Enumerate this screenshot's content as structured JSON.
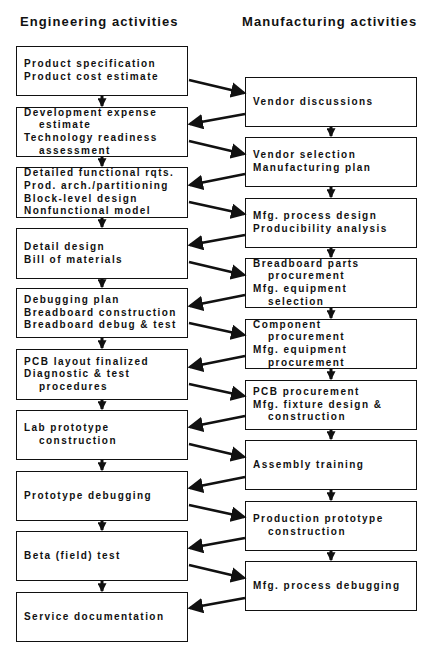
{
  "headers": {
    "engineering": "Engineering activities",
    "manufacturing": "Manufacturing activities"
  },
  "engineering": [
    {
      "lines": [
        {
          "text": "Product specification",
          "indent": false
        },
        {
          "text": "Product cost estimate",
          "indent": false
        }
      ]
    },
    {
      "lines": [
        {
          "text": "Development expense",
          "indent": false
        },
        {
          "text": "estimate",
          "indent": true
        },
        {
          "text": "Technology readiness",
          "indent": false
        },
        {
          "text": "assessment",
          "indent": true
        }
      ]
    },
    {
      "lines": [
        {
          "text": "Detailed functional rqts.",
          "indent": false
        },
        {
          "text": "Prod. arch./partitioning",
          "indent": false
        },
        {
          "text": "Block-level design",
          "indent": false
        },
        {
          "text": "Nonfunctional model",
          "indent": false
        }
      ]
    },
    {
      "lines": [
        {
          "text": "Detail design",
          "indent": false
        },
        {
          "text": "Bill of materials",
          "indent": false
        }
      ]
    },
    {
      "lines": [
        {
          "text": "Debugging plan",
          "indent": false
        },
        {
          "text": "Breadboard construction",
          "indent": false
        },
        {
          "text": "Breadboard debug & test",
          "indent": false
        }
      ]
    },
    {
      "lines": [
        {
          "text": "PCB layout finalized",
          "indent": false
        },
        {
          "text": "Diagnostic & test",
          "indent": false
        },
        {
          "text": "procedures",
          "indent": true
        }
      ]
    },
    {
      "lines": [
        {
          "text": "Lab prototype",
          "indent": false
        },
        {
          "text": "construction",
          "indent": true
        }
      ]
    },
    {
      "lines": [
        {
          "text": "Prototype debugging",
          "indent": false
        }
      ]
    },
    {
      "lines": [
        {
          "text": "Beta (field) test",
          "indent": false
        }
      ]
    },
    {
      "lines": [
        {
          "text": "Service documentation",
          "indent": false
        }
      ]
    }
  ],
  "manufacturing": [
    {
      "lines": [
        {
          "text": "Vendor discussions",
          "indent": false
        }
      ]
    },
    {
      "lines": [
        {
          "text": "Vendor selection",
          "indent": false
        },
        {
          "text": "Manufacturing plan",
          "indent": false
        }
      ]
    },
    {
      "lines": [
        {
          "text": "Mfg. process design",
          "indent": false
        },
        {
          "text": "Producibility analysis",
          "indent": false
        }
      ]
    },
    {
      "lines": [
        {
          "text": "Breadboard parts",
          "indent": false
        },
        {
          "text": "procurement",
          "indent": true
        },
        {
          "text": "Mfg. equipment",
          "indent": false
        },
        {
          "text": "selection",
          "indent": true
        }
      ]
    },
    {
      "lines": [
        {
          "text": "Component",
          "indent": false
        },
        {
          "text": "procurement",
          "indent": true
        },
        {
          "text": "Mfg. equipment",
          "indent": false
        },
        {
          "text": "procurement",
          "indent": true
        }
      ]
    },
    {
      "lines": [
        {
          "text": "PCB procurement",
          "indent": false
        },
        {
          "text": "Mfg. fixture design &",
          "indent": false
        },
        {
          "text": "construction",
          "indent": true
        }
      ]
    },
    {
      "lines": [
        {
          "text": "Assembly training",
          "indent": false
        }
      ]
    },
    {
      "lines": [
        {
          "text": "Production prototype",
          "indent": false
        },
        {
          "text": "construction",
          "indent": true
        }
      ]
    },
    {
      "lines": [
        {
          "text": "Mfg. process debugging",
          "indent": false
        }
      ]
    }
  ],
  "colors": {
    "stroke": "#111111",
    "background": "#ffffff"
  }
}
